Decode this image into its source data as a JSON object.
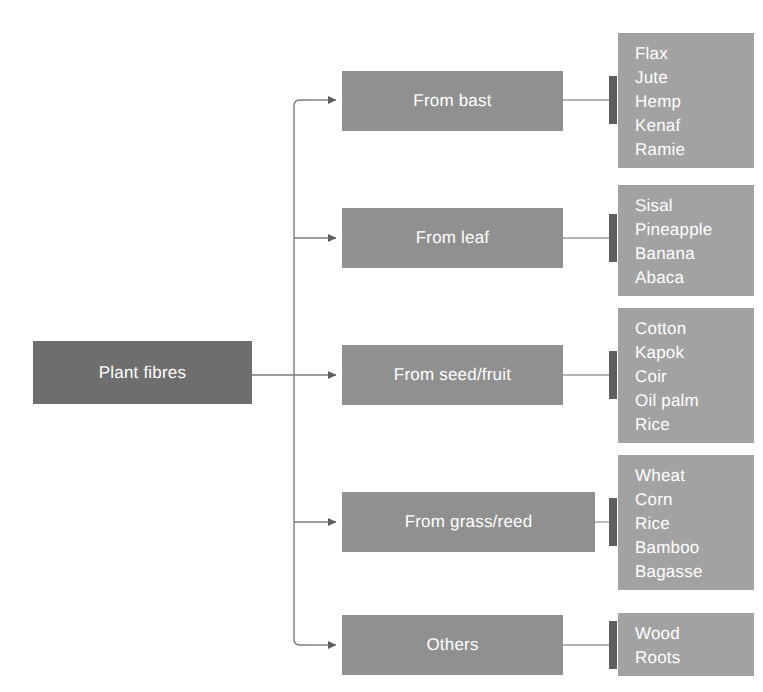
{
  "diagram": {
    "root": {
      "label": "Plant fibres"
    },
    "colors": {
      "root_fill": "#6e6e6e",
      "category_fill": "#909090",
      "list_fill": "#a2a2a2",
      "connector": "#6b6b6b",
      "tick": "#5f5f5f",
      "text": "#ffffff",
      "background": "#ffffff"
    },
    "categories": [
      {
        "label": "From bast",
        "items": [
          "Flax",
          "Jute",
          "Hemp",
          "Kenaf",
          "Ramie"
        ]
      },
      {
        "label": "From leaf",
        "items": [
          "Sisal",
          "Pineapple",
          "Banana",
          "Abaca"
        ]
      },
      {
        "label": "From seed/fruit",
        "items": [
          "Cotton",
          "Kapok",
          "Coir",
          "Oil palm",
          "Rice"
        ]
      },
      {
        "label": "From grass/reed",
        "items": [
          "Wheat",
          "Corn",
          "Rice",
          "Bamboo",
          "Bagasse"
        ]
      },
      {
        "label": "Others",
        "items": [
          "Wood",
          "Roots"
        ]
      }
    ]
  }
}
